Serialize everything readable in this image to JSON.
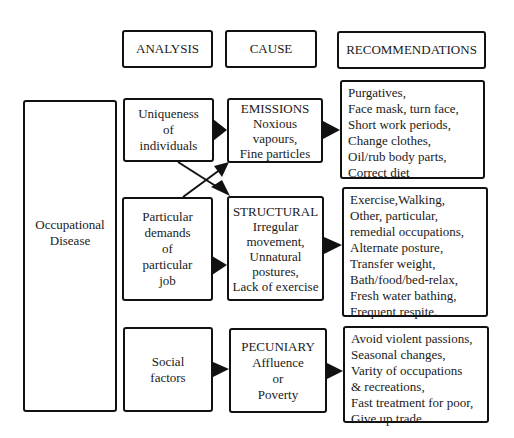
{
  "headers": {
    "analysis": "ANALYSIS",
    "cause": "CAUSE",
    "recommendations": "RECOMMENDATIONS"
  },
  "root": {
    "lines": [
      "Occupational",
      "Disease"
    ]
  },
  "analysis": [
    {
      "lines": [
        "Uniqueness",
        "of",
        "individuals"
      ]
    },
    {
      "lines": [
        "Particular",
        "demands",
        "of",
        "particular",
        "job"
      ]
    },
    {
      "lines": [
        "Social",
        "factors"
      ]
    }
  ],
  "cause": [
    {
      "lines": [
        "EMISSIONS",
        "Noxious",
        "vapours,",
        "Fine particles"
      ]
    },
    {
      "lines": [
        "STRUCTURAL",
        "Irregular",
        "movement,",
        "Unnatural",
        "postures,",
        "Lack of exercise"
      ]
    },
    {
      "lines": [
        "PECUNIARY",
        "Affluence",
        "or",
        "Poverty"
      ]
    }
  ],
  "recommendations": [
    {
      "lines": [
        "Purgatives,",
        "Face mask, turn face,",
        "Short work periods,",
        "Change clothes,",
        "Oil/rub body parts,",
        "Correct diet"
      ]
    },
    {
      "lines": [
        "Exercise,Walking,",
        "Other, particular,",
        "remedial occupations,",
        "Alternate posture,",
        "Transfer weight,",
        "Bath/food/bed-relax,",
        "Fresh water bathing,",
        "Frequent respite."
      ]
    },
    {
      "lines": [
        "Avoid violent passions,",
        "Seasonal changes,",
        "Varity of occupations",
        "& recreations,",
        "Fast treatment for poor,",
        "Give up trade"
      ]
    }
  ],
  "connections": [
    {
      "from": "Uniqueness of individuals",
      "to": "EMISSIONS"
    },
    {
      "from": "Uniqueness of individuals",
      "to": "STRUCTURAL"
    },
    {
      "from": "Particular demands of particular job",
      "to": "EMISSIONS"
    },
    {
      "from": "Particular demands of particular job",
      "to": "STRUCTURAL"
    },
    {
      "from": "Social factors",
      "to": "PECUNIARY"
    },
    {
      "from": "EMISSIONS",
      "to": "Recommendations 1"
    },
    {
      "from": "STRUCTURAL",
      "to": "Recommendations 2"
    },
    {
      "from": "PECUNIARY",
      "to": "Recommendations 3"
    }
  ]
}
